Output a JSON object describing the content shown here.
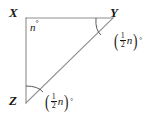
{
  "figure": {
    "type": "geometry-diagram",
    "shape": "right-triangle",
    "background_color": "#ffffff",
    "stroke_color": "#8d8d8d",
    "text_color": "#171717",
    "vertices": [
      {
        "name": "X",
        "label": "X",
        "x": 26,
        "y": 18,
        "position": "top-left",
        "is_right_angle": true
      },
      {
        "name": "Y",
        "label": "Y",
        "x": 113,
        "y": 18,
        "position": "top-right",
        "is_right_angle": false
      },
      {
        "name": "Z",
        "label": "Z",
        "x": 26,
        "y": 103,
        "position": "bottom-left",
        "is_right_angle": false
      }
    ],
    "sides": [
      {
        "name": "XY",
        "from": "X",
        "to": "Y"
      },
      {
        "name": "XZ",
        "from": "X",
        "to": "Z"
      },
      {
        "name": "ZY",
        "from": "Z",
        "to": "Y",
        "role": "hypotenuse"
      }
    ],
    "angles": [
      {
        "at_vertex": "X",
        "text": "n°",
        "variable": "n",
        "degree_symbol": "°",
        "has_arc": false
      },
      {
        "at_vertex": "Y",
        "text": "(½n)°",
        "numerator": "1",
        "denominator": "2",
        "variable": "n",
        "degree_symbol": "°",
        "has_arc": true
      },
      {
        "at_vertex": "Z",
        "text": "(½n)°",
        "numerator": "1",
        "denominator": "2",
        "variable": "n",
        "degree_symbol": "°",
        "has_arc": true
      }
    ]
  }
}
